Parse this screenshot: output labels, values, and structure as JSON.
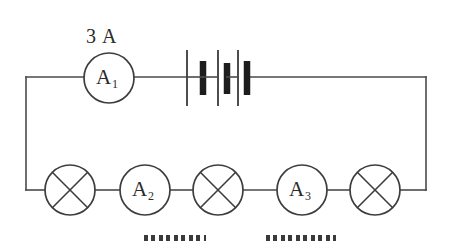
{
  "diagram": {
    "background_color": "#ffffff",
    "line_color": "#3d3d3d",
    "width": 450,
    "height": 252
  },
  "labels": {
    "current_reading": "3 A"
  },
  "meters": [
    {
      "id": "a1",
      "base": "A",
      "subscript": "1",
      "cx": 109,
      "cy": 78,
      "r": 25
    },
    {
      "id": "a2",
      "base": "A",
      "subscript": "2",
      "cx": 145,
      "cy": 190,
      "r": 25
    },
    {
      "id": "a3",
      "base": "A",
      "subscript": "3",
      "cx": 302,
      "cy": 190,
      "r": 25
    },
    {
      "id": "a1_text",
      "base": "A",
      "subscript": "1"
    }
  ],
  "lamps": [
    {
      "id": "lamp-left",
      "cx": 70,
      "cy": 190,
      "r": 25
    },
    {
      "id": "lamp-middle",
      "cx": 218,
      "cy": 190,
      "r": 25
    },
    {
      "id": "lamp-right",
      "cx": 375,
      "cy": 190,
      "r": 25
    }
  ],
  "battery": {
    "cells": 3,
    "label": "three-cell battery"
  },
  "answer_blanks": [
    {
      "id": "blank-under-a2",
      "x": 144,
      "y": 235,
      "width": 62
    },
    {
      "id": "blank-under-a3",
      "x": 266,
      "y": 235,
      "width": 70
    }
  ]
}
